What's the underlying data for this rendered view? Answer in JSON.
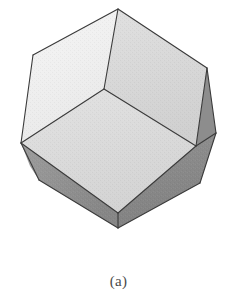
{
  "figure": {
    "caption": "(a)",
    "alt_title": "Rhombic dodecahedron crystal form",
    "background_color": "#ffffff",
    "edge_color": "#3a3a3a",
    "edge_width": 1.1,
    "faces": [
      {
        "name": "top-left-face",
        "fill": "#f1f1f1",
        "points": "118,9 104,89 21,143 33,55"
      },
      {
        "name": "top-right-face",
        "fill": "#d9d9d9",
        "points": "118,9 207,68 196,146 104,89"
      },
      {
        "name": "front-face",
        "fill": "#dcdcdc",
        "points": "104,89 196,146 118,213 21,143"
      },
      {
        "name": "right-upper-bevel-face",
        "fill": "#8d8d8d",
        "points": "207,68 216,133 196,146"
      },
      {
        "name": "right-lower-face",
        "fill": "#8a8a8a",
        "points": "196,146 216,133 200,183 118,228 118,213"
      },
      {
        "name": "bottom-left-bevel-face",
        "fill": "#8f8f8f",
        "points": "21,143 118,213 118,228 39,180"
      },
      {
        "name": "left-lower-bevel-face",
        "fill": "#9b9b9b",
        "points": "21,143 39,180 30,166"
      }
    ],
    "edges": [
      {
        "name": "edge-apex-to-center",
        "points": "118,9 104,89"
      },
      {
        "name": "edge-apex-to-upper-left",
        "points": "118,9 33,55"
      },
      {
        "name": "edge-apex-to-upper-right",
        "points": "118,9 207,68"
      },
      {
        "name": "edge-upper-left-to-left",
        "points": "33,55 21,143"
      },
      {
        "name": "edge-left-to-center",
        "points": "21,143 104,89"
      },
      {
        "name": "edge-center-to-right-mid",
        "points": "104,89 196,146"
      },
      {
        "name": "edge-upper-right-to-right-mid",
        "points": "207,68 196,146"
      },
      {
        "name": "edge-upper-right-to-right-bevel",
        "points": "207,68 216,133"
      },
      {
        "name": "edge-right-bevel-to-right-mid",
        "points": "216,133 196,146"
      },
      {
        "name": "edge-right-bevel-to-right-low",
        "points": "216,133 200,183"
      },
      {
        "name": "edge-right-mid-to-bottom-front",
        "points": "196,146 118,213"
      },
      {
        "name": "edge-left-to-bottom-front",
        "points": "21,143 118,213"
      },
      {
        "name": "edge-bottom-front-to-bottom",
        "points": "118,213 118,228"
      },
      {
        "name": "edge-right-low-to-bottom",
        "points": "200,183 118,228"
      },
      {
        "name": "edge-left-to-bottom-left-bevel",
        "points": "21,143 39,180"
      },
      {
        "name": "edge-bottom-left-bevel-to-bottom",
        "points": "39,180 118,228"
      }
    ]
  }
}
